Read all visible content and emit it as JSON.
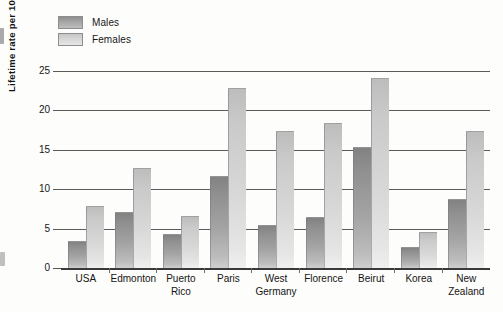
{
  "chart_data": {
    "type": "bar",
    "title": "",
    "xlabel": "",
    "ylabel": "Lifetime rate per 100 people",
    "ylim": [
      0,
      25
    ],
    "yticks": [
      "0",
      "5",
      "10",
      "15",
      "20",
      "25"
    ],
    "grid": true,
    "legend_position": "top-left",
    "categories": [
      "USA",
      "Edmonton",
      "Puerto Rico",
      "Paris",
      "West Germany",
      "Florence",
      "Beirut",
      "Korea",
      "New Zealand"
    ],
    "category_lines": [
      [
        "USA"
      ],
      [
        "Edmonton"
      ],
      [
        "Puerto",
        "Rico"
      ],
      [
        "Paris"
      ],
      [
        "West",
        "Germany"
      ],
      [
        "Florence"
      ],
      [
        "Beirut"
      ],
      [
        "Korea"
      ],
      [
        "New",
        "Zealand"
      ]
    ],
    "series": [
      {
        "name": "Males",
        "color": "#9a9a9a",
        "values": [
          3.3,
          7.0,
          4.2,
          11.6,
          5.3,
          6.4,
          15.2,
          2.6,
          8.6
        ]
      },
      {
        "name": "Females",
        "color": "#d4d4d4",
        "values": [
          7.8,
          12.6,
          6.5,
          22.7,
          17.3,
          18.3,
          24.0,
          4.4,
          17.2
        ]
      }
    ]
  },
  "legend": {
    "items": [
      {
        "label": "Males"
      },
      {
        "label": "Females"
      }
    ]
  }
}
